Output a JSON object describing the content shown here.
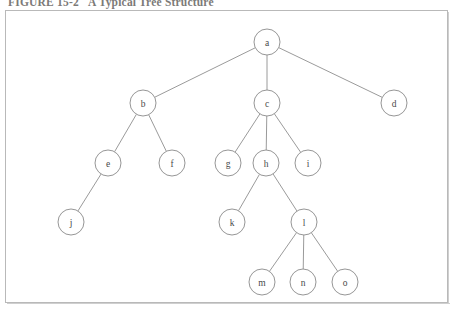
{
  "figure": {
    "number": "FIGURE 15-2",
    "title": "A Typical Tree Structure"
  },
  "colors": {
    "caption_text": "#7c7a78",
    "frame_border": "#b9b9b9",
    "node_stroke": "#8a8a8a",
    "node_fill": "#ffffff",
    "edge_stroke": "#8e8e8e",
    "label_text": "#4a4a4a",
    "page_background": "#ffffff"
  },
  "chart_data": {
    "type": "diagram",
    "diagram_kind": "tree",
    "title": "A Typical Tree Structure",
    "node_radius": 13,
    "root": "a",
    "nodes": [
      {
        "id": "a",
        "label": "a",
        "x": 267,
        "y": 42,
        "level": 0
      },
      {
        "id": "b",
        "label": "b",
        "x": 143,
        "y": 103,
        "level": 1
      },
      {
        "id": "c",
        "label": "c",
        "x": 267,
        "y": 103,
        "level": 1
      },
      {
        "id": "d",
        "label": "d",
        "x": 394,
        "y": 103,
        "level": 1
      },
      {
        "id": "e",
        "label": "e",
        "x": 108,
        "y": 163,
        "level": 2
      },
      {
        "id": "f",
        "label": "f",
        "x": 172,
        "y": 163,
        "level": 2
      },
      {
        "id": "g",
        "label": "g",
        "x": 228,
        "y": 163,
        "level": 2
      },
      {
        "id": "h",
        "label": "h",
        "x": 266,
        "y": 163,
        "level": 2
      },
      {
        "id": "i",
        "label": "i",
        "x": 308,
        "y": 163,
        "level": 2
      },
      {
        "id": "j",
        "label": "j",
        "x": 71,
        "y": 222,
        "level": 3
      },
      {
        "id": "k",
        "label": "k",
        "x": 232,
        "y": 222,
        "level": 3
      },
      {
        "id": "l",
        "label": "l",
        "x": 304,
        "y": 222,
        "level": 3
      },
      {
        "id": "m",
        "label": "m",
        "x": 262,
        "y": 282,
        "level": 4
      },
      {
        "id": "n",
        "label": "n",
        "x": 303,
        "y": 282,
        "level": 4
      },
      {
        "id": "o",
        "label": "o",
        "x": 345,
        "y": 282,
        "level": 4
      }
    ],
    "edges": [
      {
        "from": "a",
        "to": "b"
      },
      {
        "from": "a",
        "to": "c"
      },
      {
        "from": "a",
        "to": "d"
      },
      {
        "from": "b",
        "to": "e"
      },
      {
        "from": "b",
        "to": "f"
      },
      {
        "from": "c",
        "to": "g"
      },
      {
        "from": "c",
        "to": "h"
      },
      {
        "from": "c",
        "to": "i"
      },
      {
        "from": "e",
        "to": "j"
      },
      {
        "from": "h",
        "to": "k"
      },
      {
        "from": "h",
        "to": "l"
      },
      {
        "from": "l",
        "to": "m"
      },
      {
        "from": "l",
        "to": "n"
      },
      {
        "from": "l",
        "to": "o"
      }
    ]
  }
}
